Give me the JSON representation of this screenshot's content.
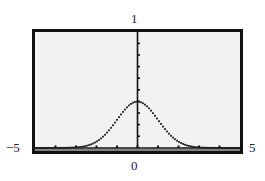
{
  "chart_data": {
    "type": "line",
    "title": "",
    "xlabel": "",
    "ylabel": "",
    "function": "standard normal density y = (1/sqrt(2*pi)) * exp(-x^2/2)",
    "xlim": [
      -5,
      5
    ],
    "ylim": [
      0,
      1
    ],
    "x_ticks": [
      -4,
      -3,
      -2,
      -1,
      0,
      1,
      2,
      3,
      4
    ],
    "y_ticks": [
      0.1,
      0.2,
      0.3,
      0.4,
      0.5,
      0.6,
      0.7,
      0.8,
      0.9
    ],
    "grid": false,
    "legend": null,
    "series": [
      {
        "name": "normal curve",
        "style": "dotted",
        "x": [
          -5,
          -4,
          -3,
          -2.5,
          -2,
          -1.5,
          -1,
          -0.5,
          0,
          0.5,
          1,
          1.5,
          2,
          2.5,
          3,
          4,
          5
        ],
        "values": [
          0.0,
          0.0001,
          0.0044,
          0.0175,
          0.054,
          0.1295,
          0.242,
          0.3521,
          0.3989,
          0.3521,
          0.242,
          0.1295,
          0.054,
          0.0175,
          0.0044,
          0.0001,
          0.0
        ]
      }
    ]
  },
  "labels": {
    "y_max": "1",
    "x_min": "−5",
    "x_max": "5",
    "x_origin": "0"
  },
  "colors": {
    "screen_bg": "#f2f2f2",
    "frame": "#111111",
    "curve": "#1a1a1a"
  }
}
